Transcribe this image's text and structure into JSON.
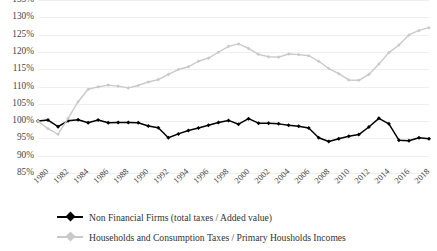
{
  "chart_data": {
    "type": "line",
    "title": "",
    "xlabel": "",
    "ylabel": "",
    "ylim": [
      85,
      135
    ],
    "ytick_step": 5,
    "ytick_labels": [
      "135%",
      "130%",
      "125%",
      "120%",
      "115%",
      "110%",
      "105%",
      "100%",
      "95%",
      "90%",
      "85%"
    ],
    "ytick_values": [
      135,
      130,
      125,
      120,
      115,
      110,
      105,
      100,
      95,
      90,
      85
    ],
    "xlim": [
      1980,
      2019
    ],
    "xtick_labels": [
      "1980",
      "1982",
      "1984",
      "1986",
      "1988",
      "1990",
      "1992",
      "1994",
      "1996",
      "1998",
      "2000",
      "2002",
      "2004",
      "2006",
      "2008",
      "2010",
      "2012",
      "2014",
      "2016",
      "2018"
    ],
    "xtick_values": [
      1980,
      1982,
      1984,
      1986,
      1988,
      1990,
      1992,
      1994,
      1996,
      1998,
      2000,
      2002,
      2004,
      2006,
      2008,
      2010,
      2012,
      2014,
      2016,
      2018
    ],
    "grid": true,
    "legend_position": "bottom",
    "x": [
      1980,
      1981,
      1982,
      1983,
      1984,
      1985,
      1986,
      1987,
      1988,
      1989,
      1990,
      1991,
      1992,
      1993,
      1994,
      1995,
      1996,
      1997,
      1998,
      1999,
      2000,
      2001,
      2002,
      2003,
      2004,
      2005,
      2006,
      2007,
      2008,
      2009,
      2010,
      2011,
      2012,
      2013,
      2014,
      2015,
      2016,
      2017,
      2018,
      2019
    ],
    "series": [
      {
        "name": "Non Financial Firms (total taxes / Added value)",
        "color": "#000000",
        "marker": "diamond",
        "values": [
          100.0,
          100.3,
          98.4,
          100.1,
          100.4,
          99.5,
          100.3,
          99.5,
          99.6,
          99.6,
          99.5,
          98.6,
          98.1,
          95.2,
          96.3,
          97.3,
          98.0,
          98.8,
          99.6,
          100.2,
          99.1,
          100.7,
          99.4,
          99.4,
          99.2,
          98.8,
          98.5,
          98.0,
          95.2,
          94.1,
          94.9,
          95.6,
          96.1,
          98.3,
          100.8,
          99.2,
          94.5,
          94.3,
          95.2,
          94.9
        ]
      },
      {
        "name": "Households and Consumption Taxes / Primary Housholds Incomes",
        "color": "#c9c9c9",
        "marker": "diamond",
        "values": [
          100.0,
          97.8,
          96.2,
          100.8,
          105.6,
          109.2,
          109.9,
          110.4,
          110.1,
          109.6,
          110.3,
          111.3,
          112.0,
          113.5,
          114.9,
          115.7,
          117.3,
          118.2,
          119.9,
          121.6,
          122.3,
          121.0,
          119.3,
          118.6,
          118.5,
          119.4,
          119.2,
          118.9,
          117.3,
          115.2,
          113.7,
          111.9,
          111.8,
          113.5,
          116.5,
          119.8,
          122.0,
          124.9,
          126.2,
          127.0
        ]
      }
    ]
  },
  "legend": {
    "items": [
      {
        "label": "Non Financial Firms (total taxes / Added value)",
        "color": "#000000"
      },
      {
        "label": "Households and Consumption Taxes / Primary Housholds Incomes",
        "color": "#c9c9c9"
      }
    ]
  }
}
